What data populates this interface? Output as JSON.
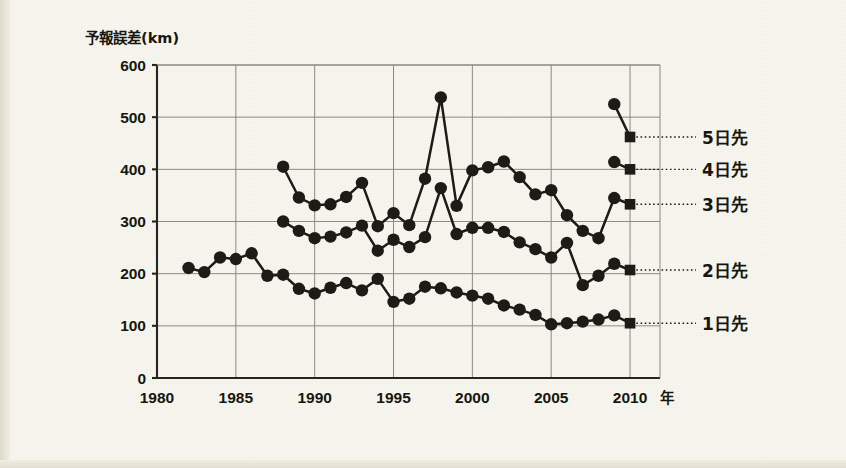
{
  "chart_data": {
    "type": "line",
    "title": "",
    "ylabel": "予報誤差(km)",
    "xlabel": "年",
    "x_unit_suffix": "年",
    "xlim": [
      1980,
      2011.9
    ],
    "ylim": [
      0,
      600
    ],
    "grid": true,
    "legend_position": "right-inline",
    "x_ticks": [
      "1980",
      "1985",
      "1990",
      "1995",
      "2000",
      "2005",
      "2010"
    ],
    "x_tick_values": [
      1980,
      1985,
      1990,
      1995,
      2000,
      2005,
      2010
    ],
    "y_ticks": [
      "0",
      "100",
      "200",
      "300",
      "400",
      "500",
      "600"
    ],
    "y_tick_values": [
      0,
      100,
      200,
      300,
      400,
      500,
      600
    ],
    "marker_styles": {
      "interior": "filled-circle",
      "terminal": "filled-square"
    },
    "series": [
      {
        "name": "5日先",
        "label": "5日先",
        "label_y": 462,
        "x": [
          2009,
          2010
        ],
        "values": [
          525,
          462
        ]
      },
      {
        "name": "4日先",
        "label": "4日先",
        "label_y": 400,
        "x": [
          2009,
          2010
        ],
        "values": [
          414,
          400
        ]
      },
      {
        "name": "3日先",
        "label": "3日先",
        "label_y": 333,
        "x": [
          1988,
          1989,
          1990,
          1991,
          1992,
          1993,
          1994,
          1995,
          1996,
          1997,
          1998,
          1999,
          2000,
          2001,
          2002,
          2003,
          2004,
          2005,
          2006,
          2007,
          2008,
          2009,
          2010
        ],
        "values": [
          405,
          346,
          331,
          333,
          347,
          374,
          291,
          316,
          293,
          382,
          538,
          330,
          398,
          404,
          415,
          385,
          352,
          360,
          312,
          282,
          268,
          345,
          333
        ]
      },
      {
        "name": "2日先",
        "label": "2日先",
        "label_y": 207,
        "x": [
          1988,
          1989,
          1990,
          1991,
          1992,
          1993,
          1994,
          1995,
          1996,
          1997,
          1998,
          1999,
          2000,
          2001,
          2002,
          2003,
          2004,
          2005,
          2006,
          2007,
          2008,
          2009,
          2010
        ],
        "values": [
          300,
          282,
          268,
          271,
          279,
          292,
          244,
          265,
          251,
          270,
          364,
          276,
          288,
          288,
          280,
          260,
          247,
          231,
          259,
          178,
          196,
          219,
          207
        ]
      },
      {
        "name": "1日先",
        "label": "1日先",
        "label_y": 105,
        "x": [
          1982,
          1983,
          1984,
          1985,
          1986,
          1987,
          1988,
          1989,
          1990,
          1991,
          1992,
          1993,
          1994,
          1995,
          1996,
          1997,
          1998,
          1999,
          2000,
          2001,
          2002,
          2003,
          2004,
          2005,
          2006,
          2007,
          2008,
          2009,
          2010
        ],
        "values": [
          211,
          203,
          231,
          228,
          239,
          196,
          198,
          171,
          162,
          173,
          182,
          168,
          190,
          146,
          152,
          175,
          172,
          164,
          158,
          152,
          139,
          131,
          121,
          103,
          105,
          108,
          112,
          120,
          105
        ]
      }
    ]
  },
  "axis": {
    "y_title": "予報誤差(km)",
    "x_unit": "年"
  }
}
